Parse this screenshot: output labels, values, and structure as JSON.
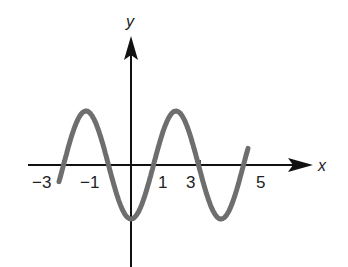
{
  "chart_data": {
    "type": "line",
    "title": "",
    "xlabel": "x",
    "ylabel": "y",
    "x_tick_labels": [
      "−3",
      "−1",
      "1",
      "3",
      "5"
    ],
    "x_ticks": [
      -3,
      -1,
      1,
      3,
      5
    ],
    "grid": false,
    "legend": null,
    "function_description": "y = -cos(pi*x/2) (period 4, zeros at odd integers, minimum at x=0)",
    "x_range": [
      -3.2,
      5.2
    ],
    "series": [
      {
        "name": "curve",
        "color": "#6e6e6e",
        "x": [
          -3.2,
          -3,
          -2,
          -1,
          0,
          1,
          2,
          3,
          4,
          5,
          5.2
        ],
        "y": [
          -0.31,
          0,
          1,
          0,
          -1,
          0,
          1,
          0,
          -1,
          0,
          0.31
        ]
      }
    ]
  },
  "axes": {
    "x_label": "x",
    "y_label": "y",
    "axis_color": "#111111"
  }
}
